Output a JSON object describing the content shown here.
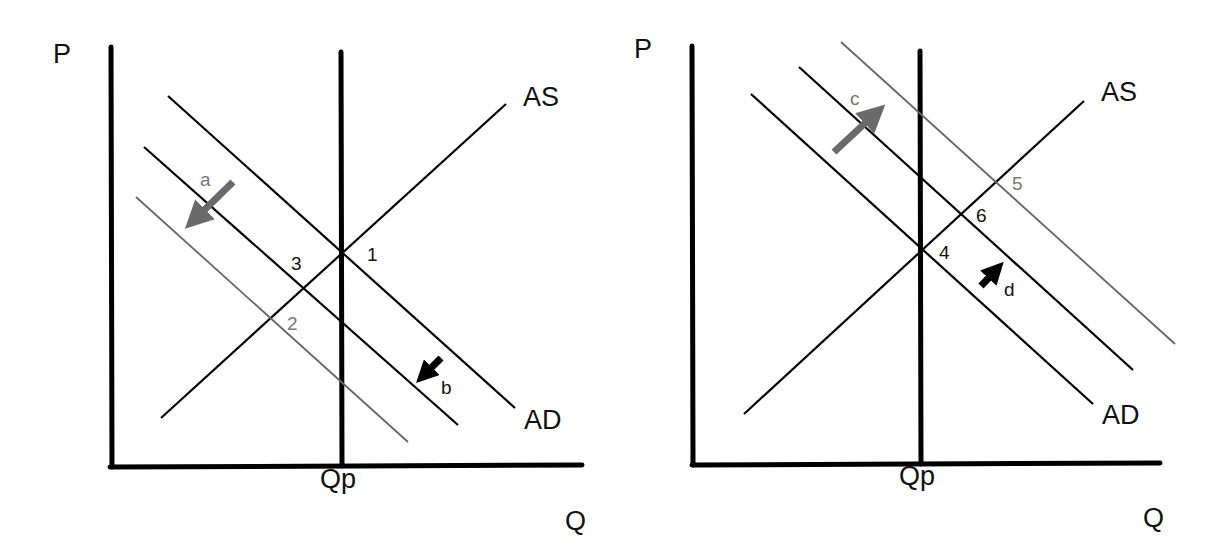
{
  "diagrams": [
    {
      "id": "left",
      "axis_labels": {
        "y": "P",
        "x": "Q"
      },
      "potential_output_label": "Qp",
      "curve_labels": {
        "supply": "AS",
        "demand": "AD"
      },
      "points": [
        "1",
        "2",
        "3"
      ],
      "arrows": [
        {
          "label": "a",
          "style": "gray",
          "direction": "down-left"
        },
        {
          "label": "b",
          "style": "black",
          "direction": "down-left"
        }
      ]
    },
    {
      "id": "right",
      "axis_labels": {
        "y": "P",
        "x": "Q"
      },
      "potential_output_label": "Qp",
      "curve_labels": {
        "supply": "AS",
        "demand": "AD"
      },
      "points": [
        "4",
        "5",
        "6"
      ],
      "arrows": [
        {
          "label": "c",
          "style": "gray",
          "direction": "up-right"
        },
        {
          "label": "d",
          "style": "black",
          "direction": "up-right"
        }
      ]
    }
  ],
  "colors": {
    "axis": "#000000",
    "curve": "#000000",
    "shifted_curve": "#666666",
    "gray_arrow": "#6a6a6a",
    "black_arrow": "#000000"
  }
}
